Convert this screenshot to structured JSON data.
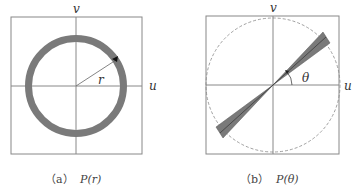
{
  "panel_a": {
    "axis_u": "u",
    "axis_v": "v",
    "radius_label": "r",
    "caption_tag": "（a）",
    "caption_expr": "P(r)",
    "colors": {
      "ring": "#7a7a7a",
      "line": "#888888"
    }
  },
  "panel_b": {
    "axis_u": "u",
    "axis_v": "v",
    "angle_label": "θ",
    "caption_tag": "（b）",
    "caption_expr": "P(θ)",
    "colors": {
      "wedge": "#7a7a7a",
      "line": "#888888"
    }
  }
}
